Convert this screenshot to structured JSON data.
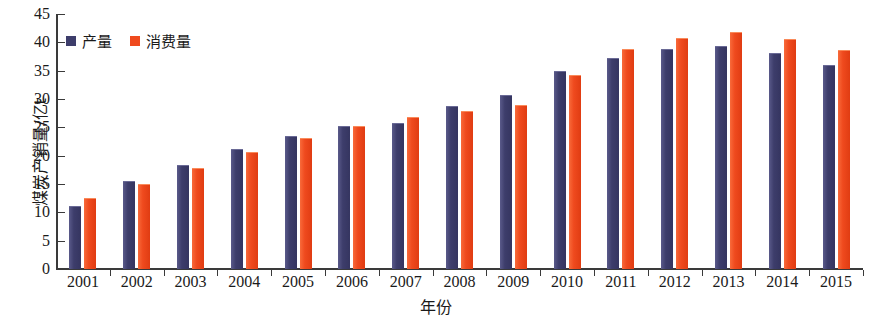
{
  "chart_data": {
    "type": "bar",
    "title": "",
    "xlabel": "年份",
    "ylabel": "煤炭产销量/亿t",
    "ylim": [
      0,
      45
    ],
    "ytick_step": 5,
    "yticks": [
      0,
      5,
      10,
      15,
      20,
      25,
      30,
      35,
      40,
      45
    ],
    "grid": false,
    "legend_position": "top-left",
    "categories": [
      "2001",
      "2002",
      "2003",
      "2004",
      "2005",
      "2006",
      "2007",
      "2008",
      "2009",
      "2010",
      "2011",
      "2012",
      "2013",
      "2014",
      "2015"
    ],
    "series": [
      {
        "name": "产量",
        "color": "#3d3d6b",
        "values": [
          11.0,
          15.3,
          18.2,
          21.0,
          23.3,
          25.0,
          25.6,
          28.6,
          30.6,
          34.8,
          37.0,
          38.7,
          39.1,
          38.0,
          35.9
        ]
      },
      {
        "name": "消费量",
        "color": "#ef4a1e",
        "values": [
          12.3,
          14.9,
          17.7,
          20.4,
          22.9,
          25.0,
          26.7,
          27.7,
          28.8,
          34.0,
          38.6,
          40.6,
          41.6,
          40.4,
          38.5
        ]
      }
    ]
  },
  "legend": {
    "items": [
      {
        "label": "产量",
        "color": "#3d3d6b",
        "icon": "square-swatch-icon"
      },
      {
        "label": "消费量",
        "color": "#ef4a1e",
        "icon": "square-swatch-icon"
      }
    ]
  },
  "axes": {
    "y_title": "煤炭产销量/亿t",
    "x_title": "年份"
  }
}
